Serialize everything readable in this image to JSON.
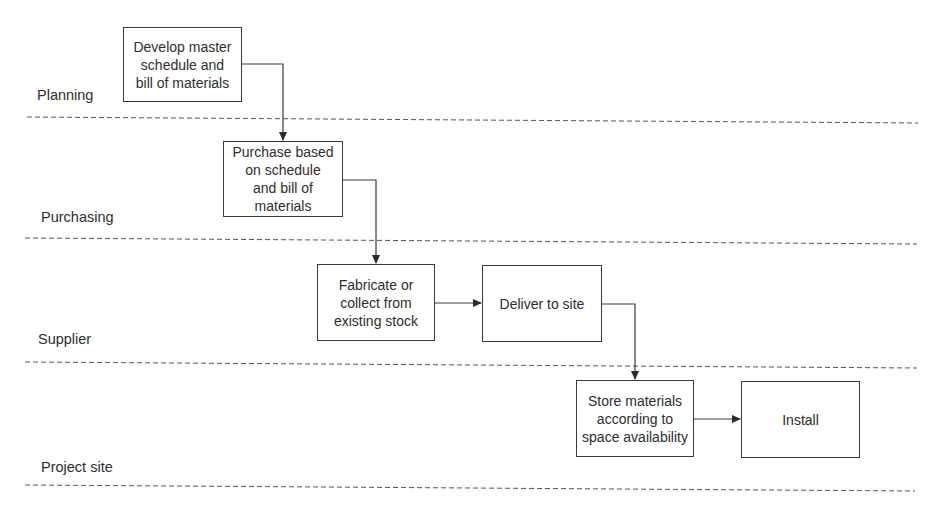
{
  "diagram": {
    "type": "swimlane-flowchart",
    "cut_off_top_text": "fragment of a line of text cut off at the top edge",
    "lanes": [
      {
        "id": "planning",
        "label": "Planning"
      },
      {
        "id": "purchasing",
        "label": "Purchasing"
      },
      {
        "id": "supplier",
        "label": "Supplier"
      },
      {
        "id": "project_site",
        "label": "Project site"
      }
    ],
    "nodes": [
      {
        "id": "n1",
        "lane": "planning",
        "label": "Develop master\nschedule and\nbill of materials"
      },
      {
        "id": "n2",
        "lane": "purchasing",
        "label": "Purchase based\non schedule\nand bill of\nmaterials"
      },
      {
        "id": "n3",
        "lane": "supplier",
        "label": "Fabricate or\ncollect from\nexisting stock"
      },
      {
        "id": "n4",
        "lane": "supplier",
        "label": "Deliver to site"
      },
      {
        "id": "n5",
        "lane": "project_site",
        "label": "Store materials\naccording to\nspace availability"
      },
      {
        "id": "n6",
        "lane": "project_site",
        "label": "Install"
      }
    ],
    "edges": [
      {
        "from": "n1",
        "to": "n2"
      },
      {
        "from": "n2",
        "to": "n3"
      },
      {
        "from": "n3",
        "to": "n4"
      },
      {
        "from": "n4",
        "to": "n5"
      },
      {
        "from": "n5",
        "to": "n6"
      }
    ],
    "colors": {
      "line": "#3a3a3a",
      "dash": "#555555",
      "background": "#ffffff",
      "text": "#2e2e2e"
    }
  }
}
